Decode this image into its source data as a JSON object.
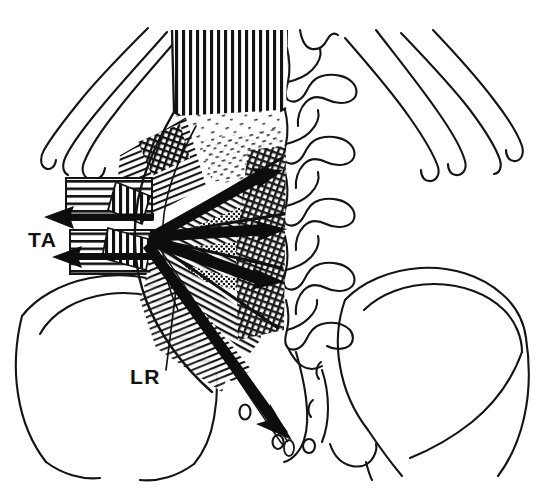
{
  "figure": {
    "domain": "Diagram",
    "background_color": "#ffffff",
    "ink_color": "#111111",
    "width": 547,
    "height": 492
  },
  "labels": [
    {
      "id": "ta",
      "text": "TA",
      "meaning": "transversus abdominis",
      "x": 28,
      "y": 247,
      "has_leader": false
    },
    {
      "id": "lr",
      "text": "LR",
      "meaning": "lateral raphe",
      "x": 130,
      "y": 384,
      "has_leader": true,
      "leader_from": [
        168,
        368
      ],
      "leader_to": [
        176,
        290
      ]
    }
  ],
  "force_vectors": {
    "left_arrows": [
      {
        "id": "ta-arrow-upper",
        "direction": "left",
        "tail": [
          152,
          215
        ],
        "head": [
          44,
          218
        ],
        "label": "TA"
      },
      {
        "id": "ta-arrow-lower",
        "direction": "left",
        "tail": [
          152,
          254
        ],
        "head": [
          52,
          258
        ],
        "label": "TA"
      }
    ],
    "fan_arrows": [
      {
        "id": "fan-arrow-1",
        "direction": "up-right",
        "tail": [
          150,
          236
        ],
        "head": [
          278,
          178
        ]
      },
      {
        "id": "fan-arrow-2",
        "direction": "right",
        "tail": [
          150,
          236
        ],
        "head": [
          282,
          233
        ]
      },
      {
        "id": "fan-arrow-3",
        "direction": "down-right",
        "tail": [
          150,
          236
        ],
        "head": [
          281,
          283
        ]
      },
      {
        "id": "fan-arrow-4",
        "direction": "down-right-steep",
        "tail": [
          150,
          236
        ],
        "head": [
          291,
          440
        ]
      }
    ],
    "convergence_point": [
      150,
      236
    ]
  },
  "anatomy": {
    "structures": [
      {
        "name": "twelfth-rib-left",
        "side": "left"
      },
      {
        "name": "eleventh-rib-left",
        "side": "left"
      },
      {
        "name": "twelfth-rib-right",
        "side": "right"
      },
      {
        "name": "eleventh-rib-right",
        "side": "right"
      },
      {
        "name": "lumbar-vertebrae",
        "count": 5,
        "side": "center"
      },
      {
        "name": "transverse-processes",
        "count": 5,
        "side": "center"
      },
      {
        "name": "sacrum",
        "side": "center"
      },
      {
        "name": "sacral-foramina",
        "count": 3
      },
      {
        "name": "iliac-crest-left",
        "side": "left"
      },
      {
        "name": "iliac-crest-right",
        "side": "right"
      },
      {
        "name": "erector-spinae-cut-surface",
        "texture": "vertical-hatch"
      },
      {
        "name": "thoracolumbar-fascia-posterior-layer",
        "texture": "stipple"
      },
      {
        "name": "thoracolumbar-fascia-middle-layer",
        "texture": "fine-hatch"
      },
      {
        "name": "quadratus-lumborum",
        "texture": "horizontal-hatch"
      },
      {
        "name": "lateral-raphe",
        "texture": "cross-hatch"
      },
      {
        "name": "aponeurosis-bands",
        "texture": "diagonal-hatch"
      }
    ]
  }
}
